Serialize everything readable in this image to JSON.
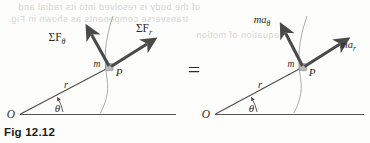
{
  "figure": {
    "caption": "Fig 12.12",
    "equals_sign": "=",
    "background_color": "#fdfdfc",
    "ink_color": "#3a3a3a",
    "arrow_color": "#4a4a4a",
    "arc_color": "#9a9a9a",
    "bleed_color": "#d7d5d2"
  },
  "left_diagram": {
    "name": "sum-of-forces-diagram",
    "origin_label": "O",
    "angle_label": "θ",
    "radius_label": "r",
    "mass_label": "m",
    "point_label": "P",
    "vectors": [
      {
        "label": "ΣF",
        "subscript": "θ",
        "direction": "transverse"
      },
      {
        "label": "ΣF",
        "subscript": "r",
        "direction": "radial"
      }
    ]
  },
  "right_diagram": {
    "name": "mass-times-acceleration-diagram",
    "origin_label": "O",
    "angle_label": "θ",
    "radius_label": "r",
    "mass_label": "m",
    "point_label": "P",
    "vectors": [
      {
        "label": "ma",
        "subscript": "θ",
        "direction": "transverse"
      },
      {
        "label": "ma",
        "subscript": "r",
        "direction": "radial"
      }
    ]
  },
  "bleed_through": {
    "line1": "of the body is resolved into its radial and",
    "line2": "transverse components as shown in Fig.",
    "line3": "equation of motion"
  }
}
